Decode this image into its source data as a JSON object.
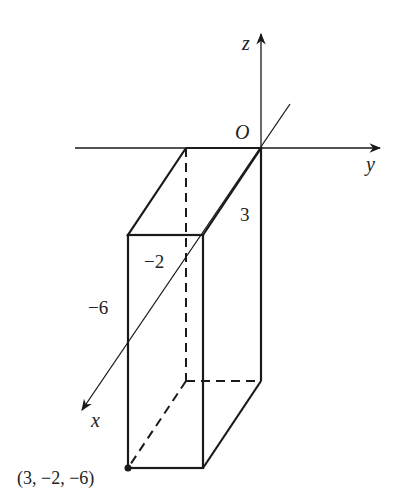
{
  "diagram": {
    "type": "3d-coordinate-box",
    "axes": {
      "x_label": "x",
      "y_label": "y",
      "z_label": "z",
      "origin_label": "O"
    },
    "dimension_labels": {
      "height": "3",
      "y_extent": "−2",
      "z_extent": "−6"
    },
    "point_label": "(3, −2, −6)",
    "colors": {
      "line": "#1a1a1a",
      "background": "#ffffff"
    }
  }
}
